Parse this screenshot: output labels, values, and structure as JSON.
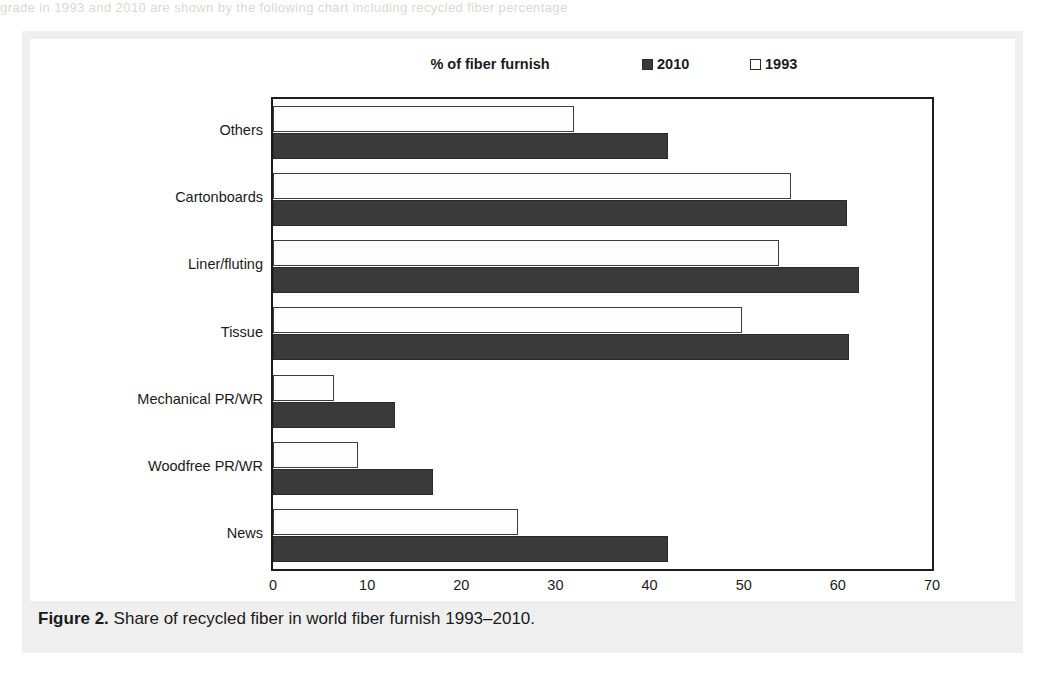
{
  "page": {
    "top_cut_text": "grade in 1993 and 2010 are shown by the following chart including recycled fiber percentage"
  },
  "caption": {
    "label": "Figure 2.",
    "text": " Share of recycled fiber in world fiber furnish 1993–2010."
  },
  "chart_data": {
    "type": "bar",
    "orientation": "horizontal",
    "title": "% of fiber furnish",
    "xlabel": "",
    "ylabel": "",
    "xlim": [
      0,
      70
    ],
    "xticks": [
      0,
      10,
      20,
      30,
      40,
      50,
      60,
      70
    ],
    "grid": false,
    "legend_position": "top-right",
    "categories": [
      "Others",
      "Cartonboards",
      "Liner/fluting",
      "Tissue",
      "Mechanical PR/WR",
      "Woodfree PR/WR",
      "News"
    ],
    "series": [
      {
        "name": "2010",
        "color": "#3a3a3a",
        "style": "filled",
        "values": [
          42.0,
          61.0,
          62.2,
          61.2,
          13.0,
          17.0,
          42.0
        ]
      },
      {
        "name": "1993",
        "color": "#ffffff",
        "style": "outline",
        "values": [
          32.0,
          55.0,
          53.8,
          49.8,
          6.5,
          9.0,
          26.0
        ]
      }
    ]
  }
}
